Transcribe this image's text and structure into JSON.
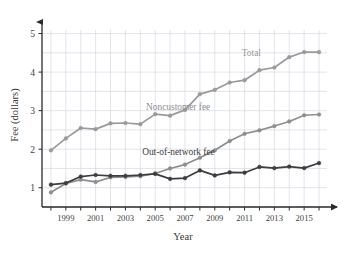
{
  "chart_data": {
    "type": "line",
    "title": "",
    "xlabel": "Year",
    "ylabel": "Fee (dollars)",
    "xlim": [
      1997.4,
      2016.4
    ],
    "ylim": [
      0.5,
      5.3
    ],
    "yticks": [
      1,
      2,
      3,
      4,
      5
    ],
    "ytick_labels": [
      "1",
      "2",
      "3",
      "4",
      "5"
    ],
    "xticks": [
      1998,
      1999,
      2000,
      2001,
      2002,
      2003,
      2004,
      2005,
      2006,
      2007,
      2008,
      2009,
      2010,
      2011,
      2012,
      2013,
      2014,
      2015,
      2016
    ],
    "xtick_labels": [
      "",
      "1999",
      "",
      "2001",
      "",
      "2003",
      "",
      "2005",
      "",
      "2007",
      "",
      "2009",
      "",
      "2011",
      "",
      "2013",
      "",
      "2015",
      ""
    ],
    "grid": true,
    "grid_color": "#ccd2dd",
    "legend_position": "inline-annotations",
    "x": [
      1998,
      1999,
      2000,
      2001,
      2002,
      2003,
      2004,
      2005,
      2006,
      2007,
      2008,
      2009,
      2010,
      2011,
      2012,
      2013,
      2014,
      2015,
      2016
    ],
    "series": [
      {
        "name": "Total",
        "color": "#9a9a9a",
        "marker": "circle",
        "values": [
          1.97,
          2.28,
          2.55,
          2.52,
          2.67,
          2.68,
          2.65,
          2.91,
          2.87,
          3.02,
          3.43,
          3.54,
          3.73,
          3.79,
          4.05,
          4.12,
          4.39,
          4.52,
          4.52
        ],
        "annotation": {
          "text": "Total",
          "x": 2012.1,
          "y": 4.42
        }
      },
      {
        "name": "Noncustomer fee",
        "color": "#8e8e8e",
        "marker": "circle",
        "values": [
          0.88,
          1.11,
          1.21,
          1.15,
          1.27,
          1.28,
          1.3,
          1.37,
          1.5,
          1.6,
          1.78,
          1.97,
          2.21,
          2.4,
          2.49,
          2.6,
          2.72,
          2.88,
          2.9
        ],
        "annotation": {
          "text": "Noncustomer fee",
          "x": 2008.7,
          "y": 3.02
        }
      },
      {
        "name": "Out-of-network fee",
        "color": "#3d3d3d",
        "marker": "circle",
        "values": [
          1.08,
          1.12,
          1.29,
          1.33,
          1.31,
          1.31,
          1.33,
          1.36,
          1.23,
          1.25,
          1.45,
          1.32,
          1.4,
          1.39,
          1.54,
          1.51,
          1.55,
          1.51,
          1.64
        ],
        "annotation": {
          "text": "Out-of-network fee",
          "x": 2009.0,
          "y": 1.86
        }
      }
    ]
  },
  "axes": {
    "y_axis_arrow": true,
    "x_axis_arrow": true
  }
}
